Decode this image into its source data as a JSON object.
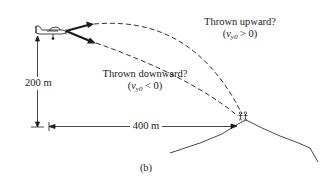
{
  "figure": {
    "caption": "(b)",
    "labels": {
      "thrown_upward": {
        "title": "Thrown upward?",
        "condition_prefix": "(",
        "var": "v",
        "var_sub": "y0",
        "condition_rel": " > 0)"
      },
      "thrown_downward": {
        "title": "Thrown downward?",
        "condition_prefix": "(",
        "var": "v",
        "var_sub": "y0",
        "condition_rel": " < 0)"
      },
      "height": "200 m",
      "distance": "400 m"
    },
    "elements": {
      "airplane": "airplane",
      "upward_trajectory": "dashed upward arc",
      "downward_trajectory": "dashed downward arc",
      "climbers": "stranded climbers on summit",
      "mountain": "mountain profile"
    },
    "colors": {
      "ink": "#1a1a1a",
      "background": "#ffffff"
    }
  }
}
